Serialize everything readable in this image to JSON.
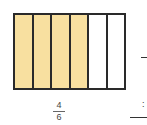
{
  "diagram": {
    "type": "fraction-bar",
    "total_parts": 6,
    "shaded_parts": 4,
    "colors": {
      "shaded": "#F8E0A0",
      "unshaded": "#FFFFFF",
      "border": "#2A2A2A"
    },
    "segments": [
      "shaded",
      "shaded",
      "shaded",
      "shaded",
      "unshaded",
      "unshaded"
    ]
  },
  "label": {
    "numerator": "4",
    "denominator": "6"
  },
  "right_edge": {
    "colon": ":"
  }
}
